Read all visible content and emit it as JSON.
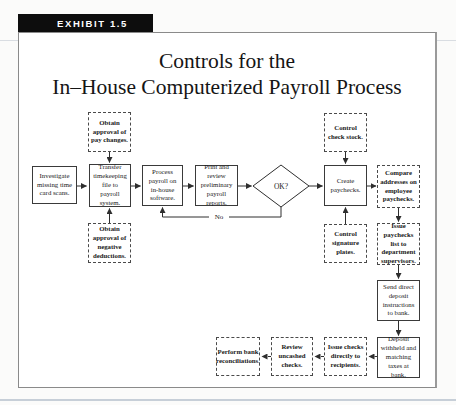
{
  "exhibit": {
    "label": "EXHIBIT 1.5"
  },
  "title": {
    "line1": "Controls for the",
    "line2": "In–House Computerized Payroll Process"
  },
  "flowchart": {
    "decision": {
      "label": "OK?"
    },
    "no_label": "No",
    "nodes": {
      "investigate": {
        "label": "Investigate missing time card scans."
      },
      "approval_pay": {
        "label": "Obtain approval of pay changes."
      },
      "transfer": {
        "label": "Transfer timekeeping file to payroll system."
      },
      "approval_neg": {
        "label": "Obtain approval of negative deductions."
      },
      "process": {
        "label": "Process payroll on in-house software."
      },
      "print_review": {
        "label": "Print and review preliminary payroll reports."
      },
      "check_stock": {
        "label": "Control check stock."
      },
      "create": {
        "label": "Create paychecks."
      },
      "signature": {
        "label": "Control signature plates."
      },
      "compare": {
        "label": "Compare addresses on employee paychecks."
      },
      "issue_list": {
        "label": "Issue paychecks list to department supervisors."
      },
      "send_direct": {
        "label": "Send direct deposit instructions to bank."
      },
      "deposit": {
        "label": "Deposit withheld and matching taxes at bank."
      },
      "issue_checks": {
        "label": "Issue checks directly to recipients."
      },
      "review_uncashed": {
        "label": "Review uncashed checks."
      },
      "perform_recon": {
        "label": "Perform bank reconciliations."
      }
    }
  },
  "colors": {
    "tag_bg": "#0d0d0d",
    "tag_text": "#ffffff",
    "line": "#2e2e2e",
    "frame_border": "#8a8a8a"
  }
}
